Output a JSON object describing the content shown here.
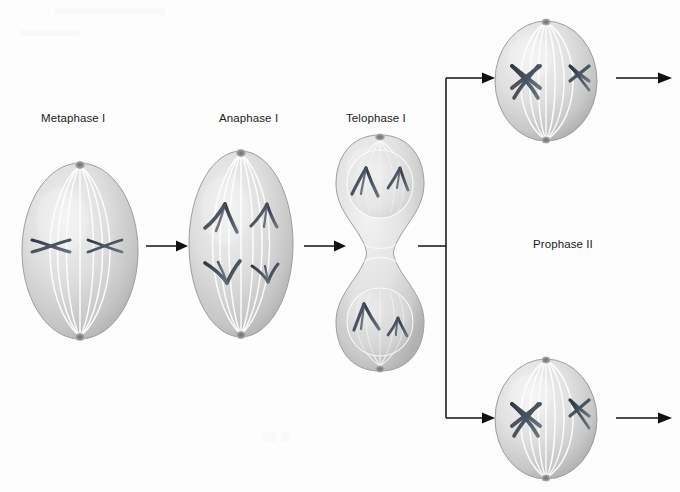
{
  "figure": {
    "background_color": "#fdfdfd",
    "width": 680,
    "height": 492
  },
  "palette": {
    "cell_body_light": "#e9e9e9",
    "cell_body_mid": "#d2d2d2",
    "cell_body_shadow": "#a8a8a8",
    "spindle_fiber": "#ffffff",
    "chromosome_dark": "#3c4550",
    "chromosome_mid": "#59626d",
    "pole_dark": "#7b7b7b",
    "arrow_color": "#111111",
    "label_color": "#1b1b1b"
  },
  "labels": [
    {
      "id": "metaphase-i",
      "text": "Metaphase I",
      "x": 41,
      "y": 112
    },
    {
      "id": "anaphase-i",
      "text": "Anaphase I",
      "x": 219,
      "y": 112
    },
    {
      "id": "telophase-i",
      "text": "Telophase I",
      "x": 346,
      "y": 112
    },
    {
      "id": "prophase-ii",
      "text": "Prophase II",
      "x": 533,
      "y": 238
    }
  ],
  "cells": [
    {
      "id": "metaphase-i-cell",
      "stage": "Metaphase I",
      "shape": "oval",
      "description": "Oval cell with spindle fibers from pole to pole; two tetrads aligned on the metaphase plate at the cell equator.",
      "x": 18,
      "y": 160,
      "width": 124,
      "height": 182,
      "chromosome_count": 2,
      "chromosome_form": "aligned-tetrad"
    },
    {
      "id": "anaphase-i-cell",
      "stage": "Anaphase I",
      "shape": "oval",
      "description": "Oval cell; homologous chromosomes as V shapes migrating toward opposite poles, larger pair on the left, smaller pair on the right.",
      "x": 185,
      "y": 148,
      "width": 112,
      "height": 192,
      "chromosome_count": 4,
      "chromosome_form": "v-shaped-migrating"
    },
    {
      "id": "telophase-i-cell",
      "stage": "Telophase I",
      "shape": "dumbbell",
      "description": "Figure-eight cell with a deep cleavage furrow; each lobe holds a reforming nucleus containing V-shaped chromosomes.",
      "x": 330,
      "y": 132,
      "width": 100,
      "height": 242,
      "chromosome_count": 4,
      "chromosome_form": "v-shaped-clustered"
    },
    {
      "id": "prophase-ii-cell-top",
      "stage": "Prophase II",
      "shape": "round",
      "description": "Round daughter cell with newly formed spindle; one large and one small X-shaped duplicated chromosome.",
      "x": 492,
      "y": 18,
      "width": 108,
      "height": 126,
      "chromosome_count": 2,
      "chromosome_form": "x-shaped-condensed"
    },
    {
      "id": "prophase-ii-cell-bottom",
      "stage": "Prophase II",
      "shape": "round",
      "description": "Round daughter cell with newly formed spindle; one large and one small X-shaped duplicated chromosome.",
      "x": 492,
      "y": 356,
      "width": 108,
      "height": 126,
      "chromosome_count": 2,
      "chromosome_form": "x-shaped-condensed"
    }
  ],
  "arrows": [
    {
      "id": "arrow-metaphase-to-anaphase",
      "type": "straight",
      "from": "metaphase-i-cell",
      "to": "anaphase-i-cell",
      "x1": 146,
      "y1": 246,
      "x2": 182,
      "y2": 246
    },
    {
      "id": "arrow-anaphase-to-telophase",
      "type": "straight",
      "from": "anaphase-i-cell",
      "to": "telophase-i-cell",
      "x1": 304,
      "y1": 246,
      "x2": 340,
      "y2": 246
    },
    {
      "id": "arrow-telophase-branch",
      "type": "branching",
      "from": "telophase-i-cell",
      "to": "prophase-ii-cells",
      "stem_x1": 418,
      "stem_x2": 446,
      "stem_y": 246,
      "bus_top": 78,
      "bus_bottom": 418,
      "tip_x": 498
    },
    {
      "id": "arrow-exit-top",
      "type": "straight",
      "from": "prophase-ii-cell-top",
      "to": "meiosis-ii",
      "x1": 614,
      "y1": 78,
      "x2": 672,
      "y2": 78
    },
    {
      "id": "arrow-exit-bottom",
      "type": "straight",
      "from": "prophase-ii-cell-bottom",
      "to": "meiosis-ii",
      "x1": 614,
      "y1": 418,
      "x2": 672,
      "y2": 418
    }
  ]
}
